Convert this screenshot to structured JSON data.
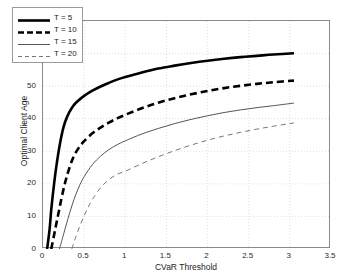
{
  "chart_data": {
    "type": "line",
    "title": "",
    "xlabel": "CVaR Threshold",
    "ylabel": "Optimal Client Age",
    "xlim": [
      0,
      3.5
    ],
    "ylim": [
      0,
      70
    ],
    "xticks": [
      "0",
      "0.5",
      "1",
      "1.5",
      "2",
      "2.5",
      "3",
      "3.5"
    ],
    "xtick_values": [
      0,
      0.5,
      1,
      1.5,
      2,
      2.5,
      3,
      3.5
    ],
    "yticks": [
      "0",
      "10",
      "20",
      "30",
      "40",
      "50",
      "60",
      "70"
    ],
    "ytick_values": [
      0,
      10,
      20,
      30,
      40,
      50,
      60,
      70
    ],
    "grid": true,
    "legend_position": "upper-left",
    "series": [
      {
        "name": "T = 5",
        "style": "solid",
        "width": 2.6,
        "color": "#000000",
        "x": [
          0.05,
          0.08,
          0.1,
          0.13,
          0.16,
          0.2,
          0.25,
          0.3,
          0.35,
          0.4,
          0.5,
          0.6,
          0.7,
          0.8,
          0.9,
          1.0,
          1.2,
          1.4,
          1.6,
          1.8,
          2.0,
          2.2,
          2.4,
          2.6,
          2.8,
          3.05
        ],
        "y": [
          0.0,
          6.0,
          12.0,
          19.0,
          25.0,
          31.5,
          37.5,
          41.0,
          43.3,
          44.9,
          47.0,
          48.6,
          49.9,
          51.0,
          52.0,
          52.8,
          54.2,
          55.4,
          56.3,
          57.1,
          57.8,
          58.4,
          58.9,
          59.3,
          59.7,
          60.1
        ]
      },
      {
        "name": "T = 10",
        "style": "dashed",
        "width": 2.6,
        "color": "#000000",
        "x": [
          0.1,
          0.14,
          0.18,
          0.22,
          0.26,
          0.3,
          0.35,
          0.4,
          0.45,
          0.5,
          0.6,
          0.7,
          0.8,
          0.9,
          1.0,
          1.2,
          1.4,
          1.6,
          1.8,
          2.0,
          2.2,
          2.4,
          2.6,
          2.8,
          3.05
        ],
        "y": [
          0.0,
          5.0,
          10.0,
          15.0,
          19.5,
          23.2,
          27.0,
          29.7,
          31.6,
          33.1,
          35.5,
          37.3,
          38.8,
          40.1,
          41.2,
          43.2,
          44.9,
          46.3,
          47.5,
          48.5,
          49.4,
          50.1,
          50.7,
          51.2,
          51.7
        ]
      },
      {
        "name": "T = 15",
        "style": "solid",
        "width": 1.0,
        "color": "#555555",
        "x": [
          0.2,
          0.25,
          0.3,
          0.35,
          0.4,
          0.45,
          0.5,
          0.6,
          0.7,
          0.8,
          0.9,
          1.0,
          1.2,
          1.4,
          1.6,
          1.8,
          2.0,
          2.2,
          2.4,
          2.6,
          2.8,
          3.05
        ],
        "y": [
          0.0,
          4.5,
          9.0,
          13.2,
          16.8,
          19.8,
          22.2,
          25.9,
          28.5,
          30.5,
          32.0,
          33.2,
          35.3,
          37.0,
          38.5,
          39.8,
          40.9,
          41.9,
          42.7,
          43.4,
          44.0,
          44.8
        ]
      },
      {
        "name": "T = 20",
        "style": "dashed",
        "width": 1.0,
        "color": "#777777",
        "x": [
          0.35,
          0.4,
          0.45,
          0.5,
          0.55,
          0.6,
          0.7,
          0.8,
          0.9,
          1.0,
          1.2,
          1.4,
          1.6,
          1.8,
          2.0,
          2.2,
          2.4,
          2.6,
          2.8,
          3.05
        ],
        "y": [
          0.0,
          3.8,
          7.2,
          10.2,
          12.9,
          15.2,
          18.8,
          21.3,
          22.9,
          23.9,
          26.2,
          28.3,
          30.2,
          31.9,
          33.4,
          34.7,
          35.8,
          36.8,
          37.7,
          38.7
        ]
      }
    ]
  },
  "legend": {
    "entries": [
      {
        "label": "T = 5"
      },
      {
        "label": "T = 10"
      },
      {
        "label": "T = 15"
      },
      {
        "label": "T = 20"
      }
    ]
  }
}
